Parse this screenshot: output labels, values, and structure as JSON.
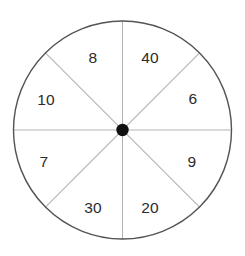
{
  "figure": {
    "name": "spinner-wheel",
    "type": "probability-spinner",
    "background_color": "#ffffff",
    "width": 245,
    "height": 256
  },
  "wheel": {
    "center_x": 122.5,
    "center_y": 130,
    "radius": 109,
    "rim_color": "#545454",
    "rim_width": 1.4,
    "spoke_color": "#b4b4b4",
    "spoke_width": 1.1,
    "hub_color": "#111111",
    "hub_radius": 6.2,
    "sector_count": 8,
    "sector_angle_degrees": 45
  },
  "sectors": [
    {
      "label": "40",
      "start_angle": -90,
      "end_angle": -45,
      "label_x": 150,
      "label_y": 58,
      "position": "top-right"
    },
    {
      "label": "6",
      "start_angle": -45,
      "end_angle": 0,
      "label_x": 193,
      "label_y": 99,
      "position": "right-upper"
    },
    {
      "label": "9",
      "start_angle": 0,
      "end_angle": 45,
      "label_x": 192,
      "label_y": 162,
      "position": "right-lower"
    },
    {
      "label": "20",
      "start_angle": 45,
      "end_angle": 90,
      "label_x": 150,
      "label_y": 208,
      "position": "bottom-right"
    },
    {
      "label": "30",
      "start_angle": 90,
      "end_angle": 135,
      "label_x": 93,
      "label_y": 208,
      "position": "bottom-left"
    },
    {
      "label": "7",
      "start_angle": 135,
      "end_angle": 180,
      "label_x": 44,
      "label_y": 162,
      "position": "left-lower"
    },
    {
      "label": "10",
      "start_angle": 180,
      "end_angle": 225,
      "label_x": 46,
      "label_y": 100,
      "position": "left-upper"
    },
    {
      "label": "8",
      "start_angle": 225,
      "end_angle": 270,
      "label_x": 93,
      "label_y": 58,
      "position": "top-left"
    }
  ]
}
